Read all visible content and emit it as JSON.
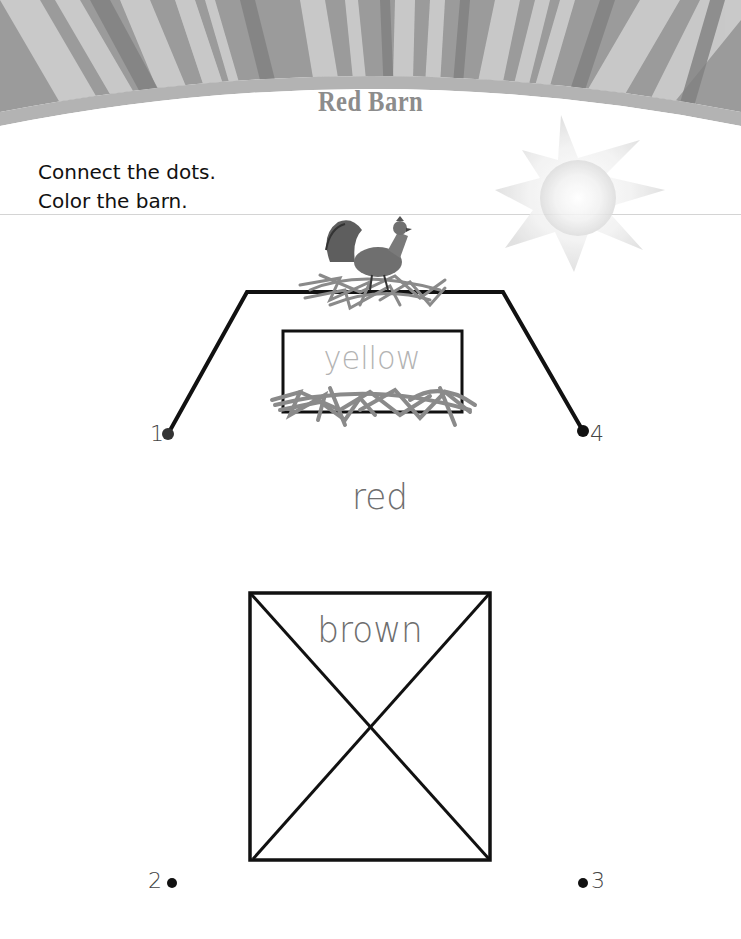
{
  "worksheet": {
    "title": "Red Barn",
    "instructions": [
      "Connect the dots.",
      "Color the barn."
    ],
    "colors": {
      "banner_base": "#9a9a9a",
      "banner_stripe_light": "#d2d2d2",
      "banner_stripe_dark": "#808080",
      "banner_arc": "#b0b0b0",
      "title": "#8c8c8c",
      "ink": "#111111",
      "straw": "#8a8a8a",
      "sun": "#e6e6e6"
    },
    "color_words": {
      "roof_window": "yellow",
      "roof": "red",
      "door": "brown"
    },
    "dots": [
      {
        "label": "1",
        "x": 168,
        "y": 434
      },
      {
        "label": "2",
        "x": 172,
        "y": 883
      },
      {
        "label": "3",
        "x": 583,
        "y": 883
      },
      {
        "label": "4",
        "x": 583,
        "y": 431
      }
    ],
    "images": {
      "rooster": "rooster-illustration",
      "sun": "sun-illustration",
      "nest_top": "straw-nest",
      "nest_bottom": "straw-pile"
    }
  }
}
